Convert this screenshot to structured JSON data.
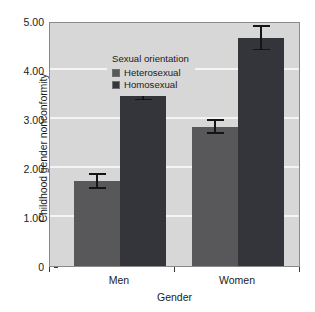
{
  "chart_data": {
    "type": "bar",
    "title": "",
    "subtitle": "",
    "xlabel": "Gender",
    "ylabel": "Childhood gender nonconformity",
    "categories": [
      "Men",
      "Women"
    ],
    "ylim": [
      0,
      5
    ],
    "ytick_labels": [
      "0",
      "1.00",
      "2.00",
      "3.00",
      "4.00",
      "5.00"
    ],
    "ytick_values": [
      0,
      1,
      2,
      3,
      4,
      5
    ],
    "grid": "horizontal-white-gridlines-at-1-2-3-4",
    "legend_position": "top-left-inside",
    "legend_title": "Sexual orientation",
    "series": [
      {
        "name": "Heterosexual",
        "color": "#58585a",
        "values": [
          1.73,
          2.84
        ],
        "err_low": [
          1.58,
          2.7
        ],
        "err_high": [
          1.89,
          3.0
        ]
      },
      {
        "name": "Homosexual",
        "color": "#34343b",
        "values": [
          3.63,
          4.65
        ],
        "err_low": [
          3.38,
          4.4
        ],
        "err_high": [
          3.9,
          4.92
        ]
      }
    ],
    "error_bar_note": "vertical capped error bars",
    "plot_background": "#d7d7d7",
    "gridline_color": "#f4f4f4",
    "axis_color": "#3a3a3a"
  }
}
